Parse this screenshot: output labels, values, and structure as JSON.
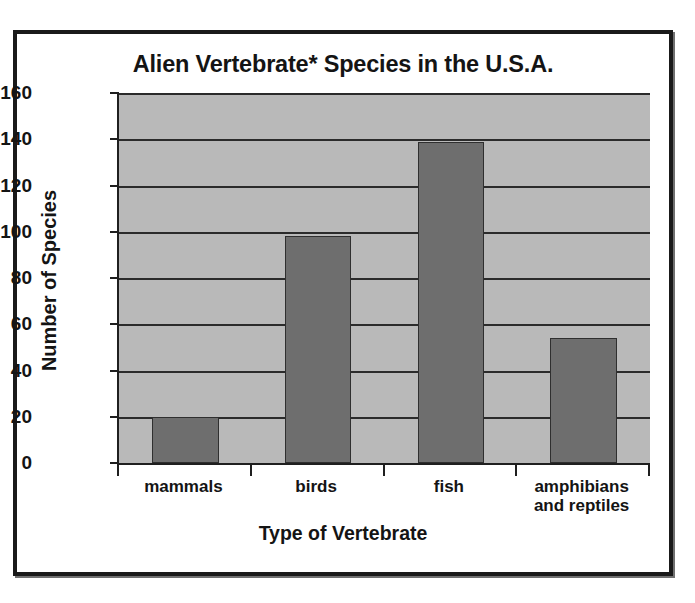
{
  "chart_data": {
    "type": "bar",
    "title": "Alien Vertebrate* Species in the U.S.A.",
    "xlabel": "Type of Vertebrate",
    "ylabel": "Number of Species",
    "categories": [
      "mammals",
      "birds",
      "fish",
      "amphibians and reptiles"
    ],
    "category_lines": [
      [
        "mammals"
      ],
      [
        "birds"
      ],
      [
        "fish"
      ],
      [
        "amphibians",
        "and reptiles"
      ]
    ],
    "values": [
      20,
      98,
      139,
      54
    ],
    "ylim": [
      0,
      160
    ],
    "yticks": [
      0,
      20,
      40,
      60,
      80,
      100,
      120,
      140,
      160
    ],
    "ytick_labels": [
      "0",
      "20",
      "40",
      "60",
      "80",
      "100",
      "120",
      "140",
      "160"
    ],
    "grid": true,
    "legend": "none",
    "colors": {
      "bar_fill": "#6e6e6e",
      "bar_outline": "#2f2f2f",
      "plot_background": "#b9b9b9",
      "gridline": "#2b2b2b",
      "axis": "#1f1f1f",
      "text": "#141414",
      "page_background": "#ffffff",
      "frame_border": "#1a1a1a"
    }
  }
}
